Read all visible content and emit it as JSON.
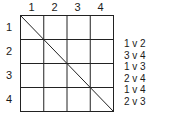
{
  "grid": {
    "columns": [
      "1",
      "2",
      "3",
      "4"
    ],
    "rows": [
      "1",
      "2",
      "3",
      "4"
    ],
    "diagonal": "top-left to bottom-right"
  },
  "matches": [
    "1 v 2",
    "3 v 4",
    "1 v 3",
    "2 v 4",
    "1 v 4",
    "2 v 3"
  ]
}
